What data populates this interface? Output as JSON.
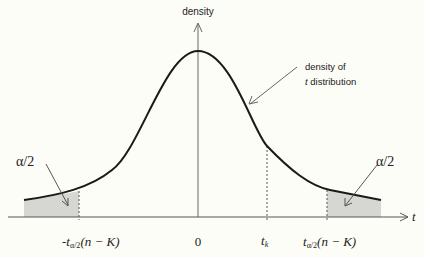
{
  "diagram": {
    "y_axis_label": "density",
    "x_axis_label": "t",
    "curve_annotation_line1": "density of",
    "curve_annotation_line2_italic": "t",
    "curve_annotation_line2_rest": " distribution",
    "left_tail_label": "α/2",
    "right_tail_label": "α/2",
    "tick_labels": {
      "left_critical_prefix": "-t",
      "left_critical_sub": "α/2",
      "left_critical_args": "(n − K)",
      "zero": "0",
      "tk_main": "t",
      "tk_sub": "k",
      "right_critical_prefix": "t",
      "right_critical_sub": "α/2",
      "right_critical_args": "(n − K)"
    },
    "colors": {
      "curve": "#1a1a1a",
      "axis": "#555555",
      "shading": "#d6d6d2",
      "background": "#fdfdf8"
    }
  }
}
